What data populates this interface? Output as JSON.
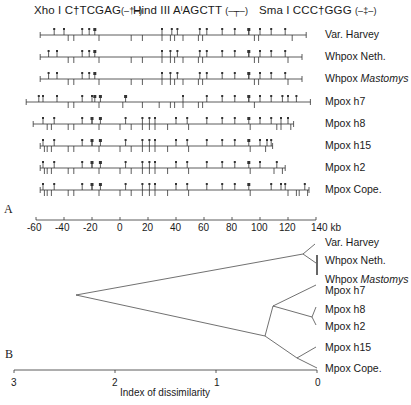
{
  "legend": {
    "xho": {
      "enzyme": "Xho I",
      "site": "C†TCGAG",
      "symbol": "(–†–)"
    },
    "hind": {
      "enzyme": "Hind III",
      "site": "AˡAGCTT",
      "symbol": "(–┬–)"
    },
    "sma": {
      "enzyme": "Sma I",
      "site": "CCC†GGG",
      "symbol": "(–‡–)"
    }
  },
  "panel_a": {
    "label": "A",
    "axis": {
      "ticks": [
        "-60",
        "-40",
        "-20",
        "0",
        "20",
        "40",
        "60",
        "80",
        "100",
        "120",
        "140 kb"
      ],
      "min": -60,
      "max": 140,
      "unit": "kb"
    },
    "maps": [
      {
        "name": "Var. Harvey",
        "italic": "",
        "start": -57,
        "end": 133,
        "xho": [
          -47,
          -40,
          -27,
          -22,
          30,
          37,
          41,
          57,
          62,
          73,
          82,
          92,
          100,
          108,
          118
        ],
        "hind": [
          -37,
          -33,
          -15,
          8,
          16,
          30,
          36,
          39,
          45,
          56,
          59,
          96,
          99,
          123
        ],
        "sma": [
          -18,
          92
        ]
      },
      {
        "name": "Whpox Neth.",
        "italic": "",
        "start": -57,
        "end": 130,
        "xho": [
          -51,
          -45,
          -27,
          -22,
          30,
          36,
          41,
          57,
          62,
          73,
          82,
          92,
          100,
          108,
          118
        ],
        "hind": [
          -37,
          -33,
          -15,
          8,
          16,
          30,
          36,
          39,
          45,
          56,
          59,
          96,
          99,
          120
        ],
        "sma": [
          -18,
          92
        ]
      },
      {
        "name": "Whpox ",
        "italic": "Mastomys",
        "start": -57,
        "end": 130,
        "xho": [
          -51,
          -45,
          -27,
          -22,
          30,
          36,
          41,
          57,
          62,
          73,
          82,
          92,
          100,
          108,
          118
        ],
        "hind": [
          -37,
          -33,
          -15,
          8,
          16,
          30,
          36,
          39,
          45,
          56,
          59,
          96,
          99,
          120
        ],
        "sma": [
          -18,
          92
        ]
      },
      {
        "name": "Mpox h7",
        "italic": "",
        "start": -67,
        "end": 136,
        "xho": [
          -58,
          -55,
          -45,
          -27,
          -20,
          45,
          62,
          73,
          82,
          92,
          100,
          108,
          116,
          120,
          126
        ],
        "hind": [
          -37,
          -33,
          -15,
          2,
          16,
          28,
          36,
          39,
          45,
          56,
          59,
          96
        ],
        "sma": [
          -18,
          -14,
          4,
          92
        ]
      },
      {
        "name": "Mpox h8",
        "italic": "",
        "start": -62,
        "end": 124,
        "xho": [
          -55,
          -47,
          -27,
          -20,
          4,
          16,
          21,
          25,
          40,
          48,
          62,
          73,
          82,
          100,
          108,
          115,
          120
        ],
        "hind": [
          -52,
          -49,
          -37,
          -33,
          -15,
          0,
          8,
          16,
          21,
          25,
          34,
          49,
          93,
          112,
          115,
          122
        ],
        "sma": [
          -20,
          -14,
          92
        ]
      },
      {
        "name": "Mpox h15",
        "italic": "",
        "start": -57,
        "end": 109,
        "xho": [
          -55,
          -47,
          -27,
          -20,
          4,
          16,
          21,
          25,
          40,
          48,
          62,
          73,
          82,
          100,
          105,
          108
        ],
        "hind": [
          -54,
          -52,
          -49,
          -37,
          -33,
          -15,
          0,
          8,
          16,
          21,
          25,
          34,
          49,
          93,
          104
        ],
        "sma": [
          -20,
          -14,
          92
        ]
      },
      {
        "name": "Mpox h2",
        "italic": "",
        "start": -57,
        "end": 118,
        "xho": [
          -55,
          -47,
          -27,
          -20,
          4,
          16,
          21,
          25,
          40,
          48,
          62,
          73,
          82,
          100,
          112
        ],
        "hind": [
          -54,
          -52,
          -49,
          -37,
          -33,
          -15,
          0,
          8,
          16,
          21,
          25,
          34,
          49,
          93,
          110,
          116
        ],
        "sma": [
          -20,
          -14,
          92
        ]
      },
      {
        "name": "Mpox Cope.",
        "italic": "",
        "start": -57,
        "end": 135,
        "xho": [
          -55,
          -47,
          -27,
          -20,
          4,
          16,
          21,
          25,
          40,
          48,
          62,
          73,
          82,
          108,
          115,
          118,
          132
        ],
        "hind": [
          -54,
          -52,
          -49,
          -37,
          -33,
          -15,
          0,
          8,
          16,
          21,
          25,
          34,
          49,
          93,
          120,
          126,
          128,
          134
        ],
        "sma": [
          -20,
          -14,
          92
        ]
      }
    ]
  },
  "panel_b": {
    "label": "B",
    "axis": {
      "ticks": [
        "3",
        "2",
        "1",
        "0"
      ],
      "title": "Index of dissimilarity"
    },
    "leaves": [
      {
        "name": "Var. Harvey",
        "italic": ""
      },
      {
        "name": "Whpox Neth.",
        "italic": ""
      },
      {
        "name": "Whpox ",
        "italic": "Mastomys"
      },
      {
        "name": "Mpox h7",
        "italic": ""
      },
      {
        "name": "Mpox h8",
        "italic": ""
      },
      {
        "name": "Mpox h2",
        "italic": ""
      },
      {
        "name": "Mpox h15",
        "italic": ""
      },
      {
        "name": "Mpox Cope.",
        "italic": ""
      }
    ]
  }
}
